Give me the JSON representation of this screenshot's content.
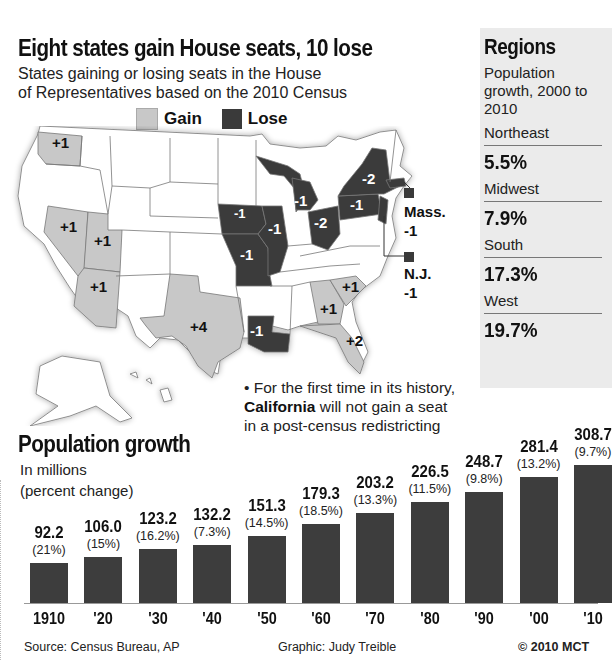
{
  "header": {
    "headline": "Eight states gain House seats, 10 lose",
    "subtitle_line1": "States gaining or losing seats in the House",
    "subtitle_line2": "of Representatives based on the 2010 Census"
  },
  "legend": {
    "gain_label": "Gain",
    "lose_label": "Lose",
    "gain_color": "#c8c8c8",
    "lose_color": "#3a3a3a"
  },
  "map": {
    "states": [
      {
        "state": "Washington",
        "change": "+1",
        "status": "gain"
      },
      {
        "state": "Nevada",
        "change": "+1",
        "status": "gain"
      },
      {
        "state": "Utah",
        "change": "+1",
        "status": "gain"
      },
      {
        "state": "Arizona",
        "change": "+1",
        "status": "gain"
      },
      {
        "state": "Texas",
        "change": "+4",
        "status": "gain"
      },
      {
        "state": "Georgia",
        "change": "+1",
        "status": "gain"
      },
      {
        "state": "South Carolina",
        "change": "+1",
        "status": "gain"
      },
      {
        "state": "Florida",
        "change": "+2",
        "status": "gain"
      },
      {
        "state": "Iowa",
        "change": "-1",
        "status": "lose"
      },
      {
        "state": "Missouri",
        "change": "-1",
        "status": "lose"
      },
      {
        "state": "Illinois",
        "change": "-1",
        "status": "lose"
      },
      {
        "state": "Michigan",
        "change": "-1",
        "status": "lose"
      },
      {
        "state": "Ohio",
        "change": "-2",
        "status": "lose"
      },
      {
        "state": "Pennsylvania",
        "change": "-1",
        "status": "lose"
      },
      {
        "state": "New York",
        "change": "-2",
        "status": "lose"
      },
      {
        "state": "Louisiana",
        "change": "-1",
        "status": "lose"
      },
      {
        "state": "Massachusetts",
        "change": "-1",
        "status": "lose"
      },
      {
        "state": "New Jersey",
        "change": "-1",
        "status": "lose"
      }
    ],
    "callouts": {
      "mass_label": "Mass.",
      "mass_value": "-1",
      "nj_label": "N.J.",
      "nj_value": "-1"
    }
  },
  "regions": {
    "title": "Regions",
    "description": "Population growth, 2000 to 2010",
    "items": [
      {
        "name": "Northeast",
        "value": "5.5%"
      },
      {
        "name": "Midwest",
        "value": "7.9%"
      },
      {
        "name": "South",
        "value": "17.3%"
      },
      {
        "name": "West",
        "value": "19.7%"
      }
    ]
  },
  "note": {
    "bullet": "•",
    "line1": "For the first time in its history,",
    "bold": "California",
    "line2_rest": " will not gain a seat",
    "line3": "in a post-census redistricting"
  },
  "chart_data": {
    "type": "bar",
    "title": "Population growth",
    "subtitle": "In millions (percent change)",
    "xlabel": "",
    "ylabel": "In millions",
    "categories": [
      "1910",
      "'20",
      "'30",
      "'40",
      "'50",
      "'60",
      "'70",
      "'80",
      "'90",
      "'00",
      "'10"
    ],
    "values": [
      92.2,
      106.0,
      123.2,
      132.2,
      151.3,
      179.3,
      203.2,
      226.5,
      248.7,
      281.4,
      308.7
    ],
    "value_labels": [
      "92.2",
      "106.0",
      "123.2",
      "132.2",
      "151.3",
      "179.3",
      "203.2",
      "226.5",
      "248.7",
      "281.4",
      "308.7"
    ],
    "percent_change": [
      "(21%)",
      "(15%)",
      "(16.2%)",
      "(7.3%)",
      "(14.5%)",
      "(18.5%)",
      "(13.3%)",
      "(11.5%)",
      "(9.8%)",
      "(13.2%)",
      "(9.7%)"
    ],
    "grid": false,
    "legend": null,
    "bar_color": "#3d3d3d"
  },
  "footer": {
    "source": "Source: Census Bureau, AP",
    "graphic": "Graphic: Judy Treible",
    "copyright": "© 2010 MCT"
  }
}
